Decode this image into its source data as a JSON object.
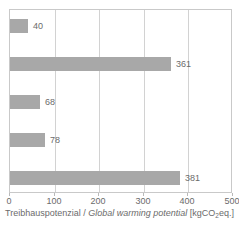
{
  "chart_data": {
    "type": "bar",
    "orientation": "horizontal",
    "title": "",
    "xlabel": "Treibhauspotenzial / Global warming potential [kgCO2eq.]",
    "ylabel": "",
    "categories": [
      "",
      "",
      "",
      "",
      ""
    ],
    "values": [
      40,
      361,
      68,
      78,
      381
    ],
    "value_labels": [
      "40",
      "361",
      "68",
      "78",
      "381"
    ],
    "xlim": [
      0,
      500
    ],
    "xticks": [
      0,
      100,
      200,
      300,
      400,
      500
    ],
    "xtick_labels": [
      "0",
      "100",
      "200",
      "300",
      "400",
      "500"
    ],
    "grid": true,
    "grid_axis": "x",
    "legend": false,
    "bar_color": "#a8a8a8",
    "frame_color": "#c9c9c9",
    "grid_color": "#d2d2d2",
    "text_color": "#6b6b6b"
  },
  "caption": {
    "label_de": "Treibhauspotenzial",
    "separator": " / ",
    "label_en": "Global warming potential",
    "unit_prefix": " [kgCO",
    "unit_subscript": "2",
    "unit_suffix": "eq.]"
  }
}
